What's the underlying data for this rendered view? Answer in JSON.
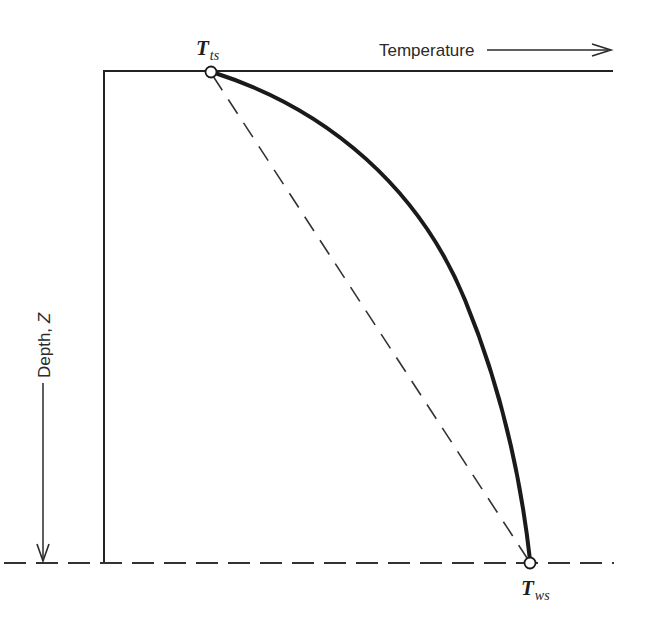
{
  "figure": {
    "type": "temperature-depth profile diagram",
    "x_axis": {
      "label": "Temperature",
      "direction": "increasing to the right (arrow)"
    },
    "y_axis": {
      "label_main": "Depth, ",
      "label_symbol": "Z",
      "direction": "increasing downward (arrow)"
    },
    "points": [
      {
        "id": "top-surface",
        "symbol": "T",
        "subscript": "ts",
        "position": "top boundary (surface)"
      },
      {
        "id": "bottom-surface",
        "symbol": "T",
        "subscript": "ws",
        "position": "bottom boundary"
      }
    ],
    "curves": [
      {
        "id": "actual-profile",
        "style": "solid thick",
        "shape": "concave nonlinear curve from T_ts to T_ws"
      },
      {
        "id": "linear-profile",
        "style": "dashed",
        "shape": "straight line from T_ts to T_ws"
      }
    ],
    "boundaries": [
      {
        "id": "top-boundary",
        "style": "solid"
      },
      {
        "id": "bottom-boundary",
        "style": "dashed"
      }
    ],
    "colors": {
      "ink": "#222222",
      "background": "#ffffff"
    }
  }
}
